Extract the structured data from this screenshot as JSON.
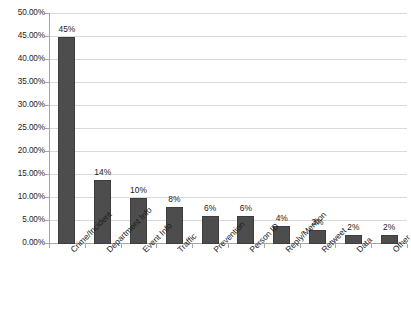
{
  "chart_data": {
    "type": "bar",
    "title": "",
    "subtitle": "",
    "xlabel": "",
    "ylabel": "",
    "ylim": [
      0,
      50
    ],
    "grid": true,
    "legend": false,
    "legend_position": "none",
    "orientation": "vertical",
    "categories": [
      "Crime/Incident",
      "Department Info",
      "Event Info",
      "Traffic",
      "Prevention",
      "Person ID",
      "Reply/Mention",
      "Retweet",
      "Data",
      "Other"
    ],
    "values": [
      45,
      14,
      10,
      8,
      6,
      6,
      4,
      3,
      2,
      2
    ],
    "data_labels": [
      "45%",
      "14%",
      "10%",
      "8%",
      "6%",
      "6%",
      "4%",
      "3%",
      "2%",
      "2%"
    ],
    "y_ticks": [
      0,
      5,
      10,
      15,
      20,
      25,
      30,
      35,
      40,
      45,
      50
    ],
    "y_tick_labels": [
      "0.00%",
      "5.00%",
      "10.00%",
      "15.00%",
      "20.00%",
      "25.00%",
      "30.00%",
      "35.00%",
      "40.00%",
      "45.00%",
      "50.00%"
    ],
    "colors": {
      "bar_fill": "#4d4d4d",
      "bar_stroke": "#3d3d3d",
      "gridline": "#d9d9d9",
      "axis": "#a6a6a6",
      "text": "#1c1c1c",
      "background": "#ffffff"
    }
  }
}
